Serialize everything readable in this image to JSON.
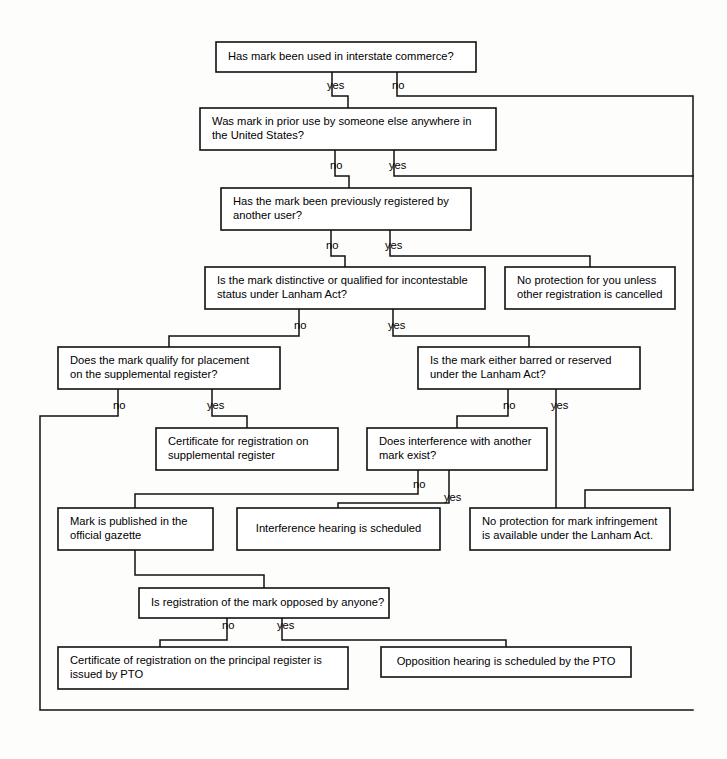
{
  "diagram": {
    "colors": {
      "background": "#fdfdfb",
      "box_fill": "#ffffff",
      "line": "#111111",
      "text": "#000000"
    },
    "nodes": [
      {
        "id": "q-interstate",
        "lines": [
          "Has mark been used in interstate commerce?"
        ],
        "x": 216,
        "y": 42,
        "w": 260,
        "h": 30,
        "align": "left",
        "pad": 12
      },
      {
        "id": "q-prior-use",
        "lines": [
          "Was mark in prior use by someone else anywhere in",
          "the United States?"
        ],
        "x": 200,
        "y": 108,
        "w": 296,
        "h": 42,
        "align": "left",
        "pad": 12
      },
      {
        "id": "q-previously-registered",
        "lines": [
          "Has the mark been previously registered by",
          "another user?"
        ],
        "x": 221,
        "y": 188,
        "w": 250,
        "h": 42,
        "align": "left",
        "pad": 12
      },
      {
        "id": "q-distinctive",
        "lines": [
          "Is the mark distinctive or qualified for incontestable",
          "status under Lanham Act?"
        ],
        "x": 205,
        "y": 267,
        "w": 280,
        "h": 42,
        "align": "left",
        "pad": 12
      },
      {
        "id": "r-no-protection-unless",
        "lines": [
          "No protection for you unless",
          "other  registration is cancelled"
        ],
        "x": 505,
        "y": 267,
        "w": 170,
        "h": 42,
        "align": "left",
        "pad": 12
      },
      {
        "id": "q-supplemental",
        "lines": [
          "Does the mark qualify for placement",
          "on the supplemental register?"
        ],
        "x": 58,
        "y": 347,
        "w": 222,
        "h": 42,
        "align": "left",
        "pad": 12
      },
      {
        "id": "q-barred-reserved",
        "lines": [
          "Is the mark either barred or reserved",
          "under the Lanham Act?"
        ],
        "x": 418,
        "y": 347,
        "w": 222,
        "h": 42,
        "align": "left",
        "pad": 12
      },
      {
        "id": "r-certificate-supplemental",
        "lines": [
          "Certificate for registration on",
          "supplemental register"
        ],
        "x": 156,
        "y": 428,
        "w": 182,
        "h": 42,
        "align": "left",
        "pad": 12
      },
      {
        "id": "q-interference",
        "lines": [
          "Does interference with another",
          "mark exist?"
        ],
        "x": 367,
        "y": 428,
        "w": 180,
        "h": 42,
        "align": "left",
        "pad": 12
      },
      {
        "id": "r-published-gazette",
        "lines": [
          "Mark is published in the",
          "official gazette"
        ],
        "x": 58,
        "y": 508,
        "w": 155,
        "h": 42,
        "align": "left",
        "pad": 12
      },
      {
        "id": "r-interference-hearing",
        "lines": [
          "Interference hearing is scheduled"
        ],
        "x": 237,
        "y": 508,
        "w": 203,
        "h": 42,
        "align": "center",
        "pad": 10
      },
      {
        "id": "r-no-protection-infringement",
        "lines": [
          "No protection for mark infringement",
          "is available under the Lanham Act."
        ],
        "x": 470,
        "y": 508,
        "w": 200,
        "h": 42,
        "align": "left",
        "pad": 12
      },
      {
        "id": "q-opposed",
        "lines": [
          "Is registration of the mark opposed by anyone?"
        ],
        "x": 139,
        "y": 588,
        "w": 250,
        "h": 30,
        "align": "left",
        "pad": 12
      },
      {
        "id": "r-certificate-principal",
        "lines": [
          "Certificate of registration on the principal register is",
          "issued by PTO"
        ],
        "x": 58,
        "y": 647,
        "w": 290,
        "h": 42,
        "align": "left",
        "pad": 12
      },
      {
        "id": "r-opposition-hearing",
        "lines": [
          "Opposition hearing is scheduled by the PTO"
        ],
        "x": 381,
        "y": 647,
        "w": 250,
        "h": 30,
        "align": "center",
        "pad": 10
      }
    ],
    "edge_labels": [
      {
        "id": "e1-yes",
        "text": "yes",
        "x": 327,
        "y": 86
      },
      {
        "id": "e1-no",
        "text": "no",
        "x": 392,
        "y": 86
      },
      {
        "id": "e2-no",
        "text": "no",
        "x": 330,
        "y": 166
      },
      {
        "id": "e2-yes",
        "text": "yes",
        "x": 389,
        "y": 166
      },
      {
        "id": "e3-no",
        "text": "no",
        "x": 326,
        "y": 246
      },
      {
        "id": "e3-yes",
        "text": "yes",
        "x": 385,
        "y": 246
      },
      {
        "id": "e4-no",
        "text": "no",
        "x": 294,
        "y": 326
      },
      {
        "id": "e4-yes",
        "text": "yes",
        "x": 388,
        "y": 326
      },
      {
        "id": "e5-no",
        "text": "no",
        "x": 113,
        "y": 406
      },
      {
        "id": "e5-yes",
        "text": "yes",
        "x": 207,
        "y": 406
      },
      {
        "id": "e6-no",
        "text": "no",
        "x": 503,
        "y": 406
      },
      {
        "id": "e6-yes",
        "text": "yes",
        "x": 551,
        "y": 406
      },
      {
        "id": "e7-no",
        "text": "no",
        "x": 413,
        "y": 485
      },
      {
        "id": "e7-yes",
        "text": "yes",
        "x": 444,
        "y": 498
      },
      {
        "id": "e8-no",
        "text": "no",
        "x": 222,
        "y": 626
      },
      {
        "id": "e8-yes",
        "text": "yes",
        "x": 277,
        "y": 626
      }
    ],
    "connectors": [
      {
        "id": "c-interstate-yes",
        "d": "M 332 72 L 332 96 L 348 96 L 348 108"
      },
      {
        "id": "c-interstate-no",
        "d": "M 397 72 L 397 96 L 693 96 L 693 490"
      },
      {
        "id": "c-prior-no",
        "d": "M 335 150 L 335 176 L 349 176 L 349 188"
      },
      {
        "id": "c-prior-yes",
        "d": "M 394 150 L 394 176 L 693 176"
      },
      {
        "id": "c-prev-no",
        "d": "M 331 230 L 331 256 L 345 256 L 345 267"
      },
      {
        "id": "c-prev-yes",
        "d": "M 390 230 L 390 256 L 590 256 L 590 267"
      },
      {
        "id": "c-dist-no",
        "d": "M 299 309 L 299 336 L 169 336 L 169 347"
      },
      {
        "id": "c-dist-yes",
        "d": "M 393 309 L 393 336 L 529 336 L 529 347"
      },
      {
        "id": "c-supp-no",
        "d": "M 118 389 L 118 416 L 40 416 L 40 710 L 693 710"
      },
      {
        "id": "c-supp-yes",
        "d": "M 212 389 L 212 416 L 247 416 L 247 428"
      },
      {
        "id": "c-barred-no",
        "d": "M 508 389 L 508 416 L 457 416 L 457 428"
      },
      {
        "id": "c-barred-yes",
        "d": "M 556 389 L 556 416 L 556 508"
      },
      {
        "id": "c-right-into-noprot",
        "d": "M 693 490 L 585 490 L 585 508"
      },
      {
        "id": "c-interf-no",
        "d": "M 418 470 L 418 494 L 135 494 L 135 508"
      },
      {
        "id": "c-interf-yes",
        "d": "M 449 470 L 449 503 L 338 503 L 338 508"
      },
      {
        "id": "c-gazette-down",
        "d": "M 135 550 L 135 575 L 264 575 L 264 588"
      },
      {
        "id": "c-opp-no",
        "d": "M 227 618 L 227 640 L 160 640 L 160 647"
      },
      {
        "id": "c-opp-yes",
        "d": "M 282 618 L 282 640 L 506 640 L 506 647"
      }
    ]
  }
}
